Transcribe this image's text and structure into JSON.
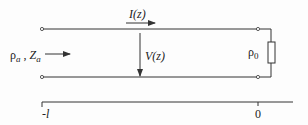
{
  "diagram": {
    "type": "transmission-line",
    "labels": {
      "current": "I(z)",
      "voltage": "V(z)",
      "source_params": "ρa , Za",
      "source_rho": "ρ",
      "source_rho_sub": "a",
      "source_sep": " , ",
      "source_z": "Z",
      "source_z_sub": "a",
      "load": "ρ",
      "load_sub": "0",
      "axis_start": "-l",
      "axis_end": "0"
    },
    "colors": {
      "line": "#333333",
      "text": "#222222",
      "background": "#fdfdfd"
    }
  }
}
